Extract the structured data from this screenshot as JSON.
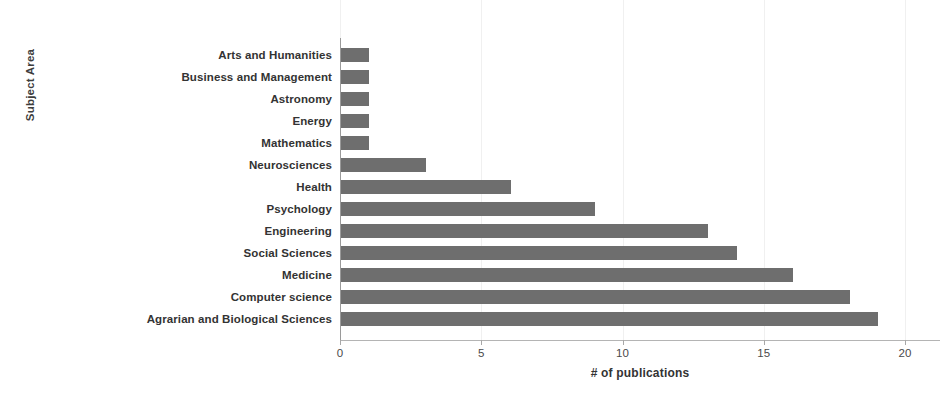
{
  "chart_data": {
    "type": "bar",
    "orientation": "horizontal",
    "title": "",
    "xlabel": "# of publications",
    "ylabel": "Subject Area",
    "categories": [
      "Arts and Humanities",
      "Business and Management",
      "Astronomy",
      "Energy",
      "Mathematics",
      "Neurosciences",
      "Health",
      "Psychology",
      "Engineering",
      "Social Sciences",
      "Medicine",
      "Computer science",
      "Agrarian and Biological Sciences"
    ],
    "values": [
      1,
      1,
      1,
      1,
      1,
      3,
      6,
      9,
      13,
      14,
      16,
      18,
      19
    ],
    "xlim": [
      0,
      20
    ],
    "xticks": [
      0,
      5,
      10,
      15,
      20
    ],
    "xtick_labels": [
      "0",
      "5",
      "10",
      "15",
      "20"
    ],
    "grid": "vertical-faint",
    "legend": "none",
    "bar_color": "#6e6e6e",
    "background_color": "#ffffff",
    "axis_color": "#9a9a9a"
  }
}
